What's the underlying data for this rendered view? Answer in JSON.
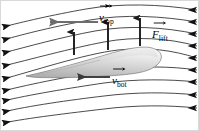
{
  "figure": {
    "type": "airfoil-lift-diagram",
    "width": 199,
    "height": 131,
    "background_color": "#ffffff",
    "border_color": "#d9d9d9"
  },
  "labels": {
    "v_top": {
      "base": "v",
      "subscript": "top",
      "has_vector_arrow": true,
      "text": "v⃗top"
    },
    "f_lift": {
      "base": "F",
      "subscript": "lift",
      "has_vector_arrow": true,
      "text": "F⃗lift"
    },
    "v_bot": {
      "base": "v",
      "subscript": "bot",
      "has_vector_arrow": true,
      "text": "v⃗bot"
    }
  },
  "airfoil": {
    "name": "wing-cross-section",
    "fill_light": "#f2f2f2",
    "fill_mid": "#c9c9c9",
    "fill_dark": "#a8a8a8",
    "outline_color": "#6e6e6e",
    "description": "Gray airfoil with rounded nose at right tapering to a sharp trailing point at left"
  },
  "streamlines": {
    "count": 9,
    "color": "#2b2b2b",
    "flow_direction": "right-to-left",
    "arrowhead_color": "#111111",
    "paths": [
      "M197,10 C160,4 120,3 86,9 C52,15 22,22 3,27",
      "M197,22 C162,16 124,14 90,20 C56,26 24,34 3,40",
      "M197,34 C164,27 128,25 95,31 C62,37 26,47 3,53",
      "M197,46 C168,38 136,36 104,42 C72,48 28,60 3,66",
      "M197,58 C172,50 148,47 118,50 C84,54 30,72 3,79",
      "M197,70 C170,66 140,66 110,70 C76,75 30,84 3,91",
      "M197,82 C168,79 136,79 104,83 C70,88 28,95 3,101",
      "M197,95 C168,92 136,92 104,96 C70,100 28,106 3,112",
      "M197,108 C168,105 136,105 104,109 C70,113 28,118 3,123"
    ]
  },
  "vertical_arrows": {
    "name": "lift-force-arrows",
    "count": 3,
    "color": "#1a1a1a",
    "direction": "up",
    "positions": [
      {
        "x": 74,
        "y_tail": 55,
        "y_head": 32
      },
      {
        "x": 108,
        "y_tail": 50,
        "y_head": 22
      },
      {
        "x": 140,
        "y_tail": 46,
        "y_head": 18
      }
    ]
  },
  "horizontal_arrows": {
    "v_top_arrow": {
      "name": "velocity-top-arrow",
      "color": "#6d6d6d",
      "x_tail": 98,
      "x_head": 50,
      "y": 22,
      "direction": "left"
    },
    "v_bot_arrow": {
      "name": "velocity-bottom-arrow",
      "color": "#3a3a3a",
      "x_tail": 110,
      "x_head": 78,
      "y": 77,
      "direction": "left"
    }
  }
}
